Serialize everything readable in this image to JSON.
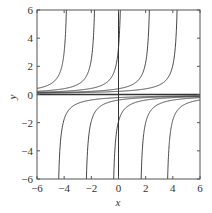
{
  "chart_data": {
    "type": "line",
    "title": "",
    "xlabel": "x",
    "ylabel": "y",
    "xlim": [
      -6,
      6
    ],
    "ylim": [
      -6,
      6
    ],
    "xticks": [
      -6,
      -4,
      -2,
      0,
      2,
      4,
      6
    ],
    "yticks": [
      -6,
      -4,
      -2,
      0,
      2,
      4,
      6
    ],
    "xtick_labels": [
      "−6",
      "−4",
      "−2",
      "0",
      "2",
      "4",
      "6"
    ],
    "ytick_labels": [
      "−6",
      "−4",
      "−2",
      "0",
      "2",
      "4",
      "6"
    ],
    "grid": false,
    "legend": null,
    "series": [
      {
        "name": "positive-branch C=-3.67",
        "C": -3.67,
        "branch": "left"
      },
      {
        "name": "positive-branch C=-1.6",
        "C": -1.6,
        "branch": "left"
      },
      {
        "name": "positive-branch C=0.3",
        "C": 0.3,
        "branch": "left"
      },
      {
        "name": "positive-branch C=2.44",
        "C": 2.44,
        "branch": "left"
      },
      {
        "name": "positive-branch C=4.48",
        "C": 4.48,
        "branch": "left"
      },
      {
        "name": "negative-branch C=-4.57",
        "C": -4.57,
        "branch": "right"
      },
      {
        "name": "negative-branch C=-2.53",
        "C": -2.53,
        "branch": "right"
      },
      {
        "name": "negative-branch C=-0.52",
        "C": -0.52,
        "branch": "right"
      },
      {
        "name": "negative-branch C=1.5",
        "C": 1.5,
        "branch": "right"
      },
      {
        "name": "negative-branch C=3.45",
        "C": 3.45,
        "branch": "right"
      },
      {
        "name": "equilibrium y=0",
        "constant": 0
      }
    ],
    "reference_lines": [
      {
        "orientation": "vertical",
        "x": 0
      }
    ]
  },
  "colors": {
    "curve": "#333333",
    "axes": "#555555",
    "text": "#333333"
  }
}
